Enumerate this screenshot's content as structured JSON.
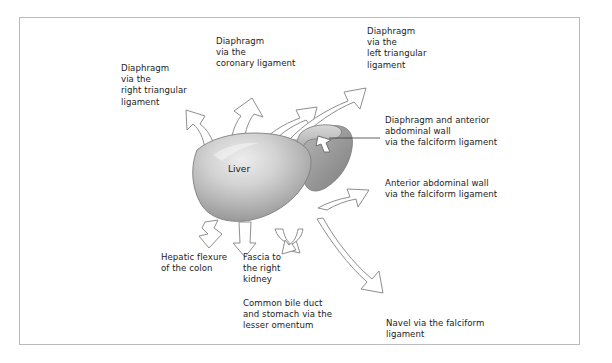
{
  "figure": {
    "type": "anatomical-diagram",
    "organ_label": "Liver",
    "border_color": "#b9bcbf",
    "background_color": "#ffffff",
    "liver_fill_light": "#e9e9e9",
    "liver_fill_mid": "#b4b4b4",
    "liver_fill_dark": "#8d8d8d",
    "left_lobe_fill": "#9a9a9a",
    "arrow_stroke": "#8a8a8a",
    "text_color": "#1c1c1c"
  },
  "labels": {
    "right_triangular": "Diaphragm\nvia the\nright triangular\nligament",
    "coronary": "Diaphragm\nvia the\ncoronary ligament",
    "left_triangular": "Diaphragm\nvia the\nleft triangular\nligament",
    "diaphragm_anterior": "Diaphragm and anterior\nabdominal wall\nvia the falciform ligament",
    "anterior_wall": "Anterior abdominal wall\nvia the falciform ligament",
    "hepatic_flexure": "Hepatic flexure\nof the colon",
    "fascia_kidney": "Fascia to\nthe right\nkidney",
    "common_bile_duct": "Common bile duct\nand stomach via the\nlesser omentum",
    "navel": "Navel via the falciform\nligament"
  }
}
